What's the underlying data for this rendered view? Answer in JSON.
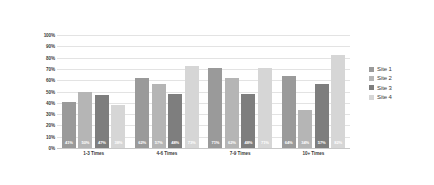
{
  "chart_data": {
    "type": "bar",
    "title": "",
    "subtitle": "",
    "xlabel": "",
    "ylabel": "",
    "categories": [
      "1-3 Times",
      "4-6 Times",
      "7-9 Times",
      "10+ Times"
    ],
    "series": [
      {
        "name": "Site 1",
        "color": "#9a9a9a",
        "values": [
          41,
          62,
          71,
          64
        ],
        "labels": [
          "41%",
          "62%",
          "71%",
          "64%"
        ]
      },
      {
        "name": "Site 2",
        "color": "#b5b5b5",
        "values": [
          50,
          57,
          62,
          34
        ],
        "labels": [
          "50%",
          "57%",
          "62%",
          "34%"
        ]
      },
      {
        "name": "Site 3",
        "color": "#7e7e7e",
        "values": [
          47,
          48,
          48,
          57
        ],
        "labels": [
          "47%",
          "48%",
          "48%",
          "57%"
        ]
      },
      {
        "name": "Site 4",
        "color": "#d6d6d6",
        "values": [
          38,
          73,
          71,
          82
        ],
        "labels": [
          "38%",
          "73%",
          "71%",
          "82%"
        ]
      }
    ],
    "ylim": [
      0,
      100
    ],
    "y_ticks": [
      "100%",
      "90%",
      "80%",
      "70%",
      "60%",
      "50%",
      "40%",
      "30%",
      "20%",
      "10%",
      "0%"
    ],
    "y_tick_values": [
      100,
      90,
      80,
      70,
      60,
      50,
      40,
      30,
      20,
      10,
      0
    ],
    "grid": true,
    "legend_position": "right",
    "value_labels_inside_bars": true,
    "background_color": "#ffffff",
    "gridline_color": "#e3e3e3",
    "text_color": "#3a3a3a"
  }
}
